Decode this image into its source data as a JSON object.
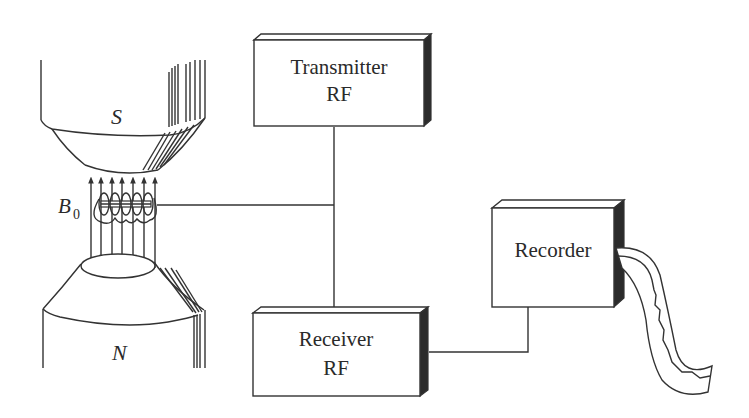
{
  "diagram": {
    "magnet": {
      "south_pole_label": "S",
      "north_pole_label": "N",
      "field_label": "B",
      "field_subscript": "0",
      "field_line_count": 7
    },
    "blocks": [
      {
        "id": "transmitter",
        "line1": "Transmitter",
        "line2": "RF"
      },
      {
        "id": "receiver",
        "line1": "Receiver",
        "line2": "RF"
      },
      {
        "id": "recorder",
        "line1": "Recorder"
      }
    ],
    "connections": [
      {
        "from": "coil",
        "to": "junction"
      },
      {
        "from": "transmitter",
        "to": "junction"
      },
      {
        "from": "junction",
        "to": "receiver"
      },
      {
        "from": "receiver",
        "to": "recorder"
      }
    ],
    "colors": {
      "line": "#333333",
      "shade": "#2b2b2b",
      "background": "#ffffff"
    }
  }
}
